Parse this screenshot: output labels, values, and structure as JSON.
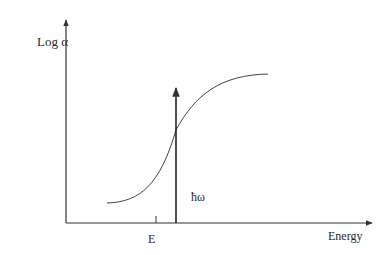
{
  "diagram": {
    "y_axis_label": "Log α",
    "x_axis_label": "Energy",
    "tick_label": "E",
    "arrow_label": "ħω",
    "line_color": "#333333"
  }
}
